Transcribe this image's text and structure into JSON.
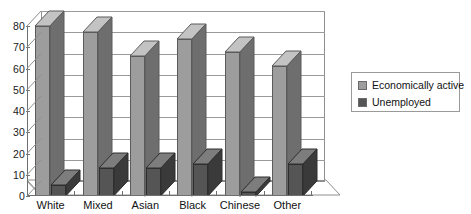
{
  "chart_data": {
    "type": "bar",
    "title": "",
    "subtitle": "",
    "xlabel": "",
    "ylabel": "",
    "ylim": [
      0,
      80
    ],
    "ytick_step": 10,
    "yticks": [
      "0",
      "10",
      "20",
      "30",
      "40",
      "50",
      "60",
      "70",
      "80"
    ],
    "grid": true,
    "three_d": true,
    "legend_position": "right",
    "categories": [
      "White",
      "Mixed",
      "Asian",
      "Black",
      "Chinese",
      "Other"
    ],
    "series": [
      {
        "name": "Economically active",
        "color": "#9d9d9d",
        "values": [
          80,
          77,
          66,
          74,
          68,
          61
        ]
      },
      {
        "name": "Unemployed",
        "color": "#555555",
        "values": [
          5,
          13,
          13,
          15,
          2,
          15
        ]
      }
    ]
  },
  "legend": {
    "items": [
      {
        "label": "Economically active",
        "color": "#9d9d9d"
      },
      {
        "label": "Unemployed",
        "color": "#555555"
      }
    ]
  },
  "axis": {
    "y_tick_labels": [
      "80",
      "70",
      "60",
      "50",
      "40",
      "30",
      "20",
      "10",
      "0"
    ],
    "x_tick_labels": [
      "White",
      "Mixed",
      "Asian",
      "Black",
      "Chinese",
      "Other"
    ]
  },
  "colors": {
    "series_active_face": "#9d9d9d",
    "series_active_top": "#c3c3c3",
    "series_active_side": "#6e6e6e",
    "series_unemployed_face": "#555555",
    "series_unemployed_top": "#7d7d7d",
    "series_unemployed_side": "#3a3a3a",
    "gridline": "#9a9a9a",
    "axis": "#6f6f6f",
    "plot_background": "#ffffff",
    "page_background": "#ffffff"
  }
}
